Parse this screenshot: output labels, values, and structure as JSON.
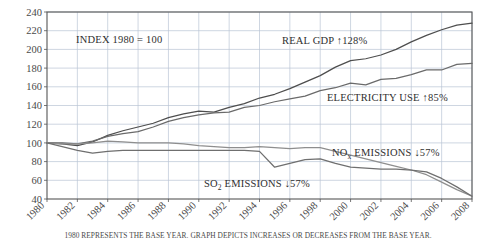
{
  "footnote": "1980 REPRESENTS THE BASE YEAR. GRAPH DEPICTS INCREASES OR DECREASES FROM THE BASE YEAR.",
  "annotations": {
    "index_note": "INDEX 1980 = 100",
    "gdp_label_text": "REAL GDP ↑128%",
    "electricity_label_text": "ELECTRICITY USE ↑85%",
    "nox_label_main": "NO",
    "nox_label_sub": "x",
    "nox_label_tail": " EMISSIONS ↓57%",
    "so2_label_main": "SO",
    "so2_label_sub": "2",
    "so2_label_tail": " EMISSIONS ↓57%"
  },
  "colors": {
    "gridline": "#b9c4d4",
    "axis_border": "#565656",
    "gdp_line": "#4e4e4e",
    "electricity_line": "#6a6a6a",
    "nox_line": "#8e8e8e",
    "so2_line": "#6f6f6f",
    "background": "#ffffff",
    "text": "#3a3a3a"
  },
  "chart_data": {
    "type": "line",
    "title": "",
    "subtitle": "",
    "xlabel": "",
    "ylabel": "",
    "xlim": [
      1980,
      2008
    ],
    "ylim": [
      40,
      240
    ],
    "ytick_step": 20,
    "grid": true,
    "legend_position": "inline-annotations",
    "yticks": [
      40,
      60,
      80,
      100,
      120,
      140,
      160,
      180,
      200,
      220,
      240
    ],
    "xticks": [
      1980,
      1982,
      1984,
      1986,
      1988,
      1990,
      1992,
      1994,
      1996,
      1998,
      2000,
      2002,
      2004,
      2006,
      2008
    ],
    "x": [
      1980,
      1981,
      1982,
      1983,
      1984,
      1985,
      1986,
      1987,
      1988,
      1989,
      1990,
      1991,
      1992,
      1993,
      1994,
      1995,
      1996,
      1997,
      1998,
      1999,
      2000,
      2001,
      2002,
      2003,
      2004,
      2005,
      2006,
      2007,
      2008
    ],
    "series": [
      {
        "name": "REAL GDP",
        "change_label": "↑128%",
        "color": "#4e4e4e",
        "values": [
          100,
          99,
          97,
          101,
          108,
          113,
          117,
          121,
          127,
          131,
          134,
          133,
          138,
          142,
          148,
          152,
          158,
          165,
          172,
          181,
          188,
          190,
          194,
          200,
          208,
          215,
          221,
          226,
          228
        ]
      },
      {
        "name": "ELECTRICITY USE",
        "change_label": "↑85%",
        "color": "#6a6a6a",
        "values": [
          100,
          100,
          99,
          102,
          107,
          110,
          112,
          117,
          123,
          127,
          130,
          132,
          133,
          138,
          140,
          144,
          147,
          150,
          156,
          159,
          164,
          162,
          168,
          169,
          173,
          178,
          178,
          184,
          185
        ]
      },
      {
        "name": "NOx EMISSIONS",
        "change_label": "↓57%",
        "color": "#8e8e8e",
        "values": [
          100,
          99,
          99,
          100,
          102,
          101,
          100,
          100,
          100,
          99,
          97,
          96,
          95,
          95,
          96,
          95,
          94,
          95,
          95,
          91,
          87,
          83,
          79,
          75,
          71,
          66,
          58,
          50,
          43
        ]
      },
      {
        "name": "SO2 EMISSIONS",
        "change_label": "↓57%",
        "color": "#6f6f6f",
        "values": [
          100,
          96,
          92,
          89,
          91,
          92,
          92,
          92,
          92,
          92,
          92,
          92,
          92,
          92,
          91,
          74,
          78,
          82,
          83,
          78,
          74,
          73,
          72,
          72,
          71,
          69,
          62,
          53,
          43
        ]
      }
    ]
  }
}
